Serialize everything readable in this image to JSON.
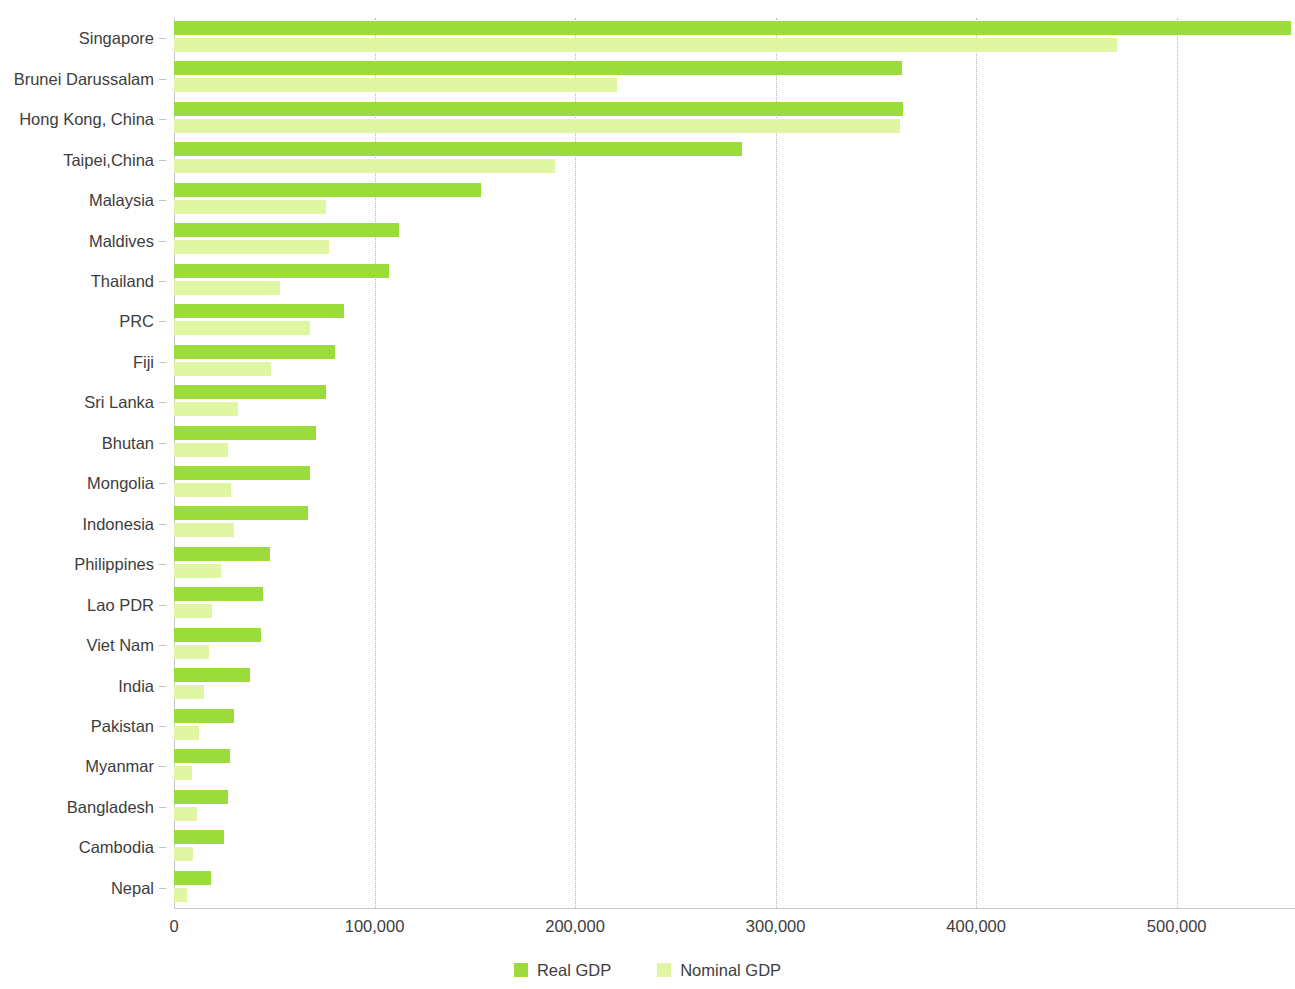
{
  "chart_data": {
    "type": "bar",
    "orientation": "horizontal",
    "title": "",
    "subtitle": "",
    "xlabel": "",
    "ylabel": "",
    "xlim": [
      0,
      558000
    ],
    "grid": true,
    "grid_axis": "x",
    "legend_position": "bottom-center",
    "x_ticks": [
      0,
      100000,
      200000,
      300000,
      400000,
      500000
    ],
    "x_tick_labels": [
      "0",
      "100,000",
      "200,000",
      "300,000",
      "400,000",
      "500,000"
    ],
    "categories": [
      "Singapore",
      "Brunei Darussalam",
      "Hong Kong, China",
      "Taipei,China",
      "Malaysia",
      "Maldives",
      "Thailand",
      "PRC",
      "Fiji",
      "Sri Lanka",
      "Bhutan",
      "Mongolia",
      "Indonesia",
      "Philippines",
      "Lao PDR",
      "Viet Nam",
      "India",
      "Pakistan",
      "Myanmar",
      "Bangladesh",
      "Cambodia",
      "Nepal"
    ],
    "series": [
      {
        "name": "Real GDP",
        "color": "#9bdc3c",
        "values": [
          557000,
          363000,
          363500,
          283000,
          153000,
          112000,
          107000,
          85000,
          80500,
          76000,
          71000,
          68000,
          67000,
          48000,
          44500,
          43500,
          38000,
          30000,
          28000,
          27000,
          25000,
          18500
        ]
      },
      {
        "name": "Nominal GDP",
        "color": "#e0f6a3",
        "values": [
          470000,
          221000,
          362000,
          190000,
          76000,
          77500,
          53000,
          68000,
          48500,
          32000,
          27000,
          28500,
          30000,
          23500,
          19000,
          17500,
          15000,
          12500,
          9000,
          11500,
          9500,
          6500
        ]
      }
    ]
  },
  "legend": {
    "items": [
      {
        "label": "Real GDP",
        "color": "#9bdc3c"
      },
      {
        "label": "Nominal GDP",
        "color": "#e0f6a3"
      }
    ]
  }
}
